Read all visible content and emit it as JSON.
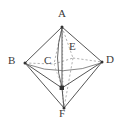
{
  "figure": {
    "name": "octahedron-diagram",
    "type": "geometry-solid-diagram",
    "shape": "octahedron",
    "background_color": "#ffffff",
    "stroke_color": "#4a4a4a",
    "hidden_stroke_color": "#9a9a9a",
    "label_color": "#3a3a3a",
    "width": 125,
    "height": 127
  },
  "labels": {
    "a": "A",
    "b": "B",
    "c": "C",
    "d": "D",
    "e": "E",
    "f": "F"
  },
  "vertices": [
    {
      "id": "A",
      "label": "A",
      "x": 62,
      "y": 27,
      "visible": true,
      "marker": "dot",
      "label_x": 58,
      "label_y": 11
    },
    {
      "id": "B",
      "label": "B",
      "x": 25,
      "y": 63,
      "visible": true,
      "marker": "dot",
      "label_x": 10,
      "label_y": 57
    },
    {
      "id": "C",
      "label": "C",
      "x": 54,
      "y": 64,
      "visible": false,
      "marker": "none",
      "label_x": 43,
      "label_y": 57
    },
    {
      "id": "D",
      "label": "D",
      "x": 102,
      "y": 62,
      "visible": true,
      "marker": "dot",
      "label_x": 106,
      "label_y": 56
    },
    {
      "id": "E",
      "label": "E",
      "x": 73,
      "y": 58,
      "visible": false,
      "marker": "none",
      "label_x": 68,
      "label_y": 43
    },
    {
      "id": "F",
      "label": "F",
      "x": 64,
      "y": 108,
      "visible": true,
      "marker": "dot",
      "label_x": 59,
      "label_y": 109
    },
    {
      "id": "G",
      "label": "",
      "x": 62,
      "y": 88,
      "visible": true,
      "marker": "square",
      "label_x": 0,
      "label_y": 0
    }
  ],
  "edges": [
    {
      "from": "A",
      "to": "B",
      "style": "solid"
    },
    {
      "from": "A",
      "to": "D",
      "style": "solid"
    },
    {
      "from": "A",
      "to": "G",
      "style": "solid"
    },
    {
      "from": "A",
      "to": "E",
      "style": "dashed"
    },
    {
      "from": "A",
      "to": "C",
      "style": "dashed"
    },
    {
      "from": "B",
      "to": "G",
      "style": "solid"
    },
    {
      "from": "D",
      "to": "G",
      "style": "solid"
    },
    {
      "from": "B",
      "to": "F",
      "style": "solid"
    },
    {
      "from": "D",
      "to": "F",
      "style": "solid"
    },
    {
      "from": "G",
      "to": "F",
      "style": "solid"
    },
    {
      "from": "B",
      "to": "C",
      "style": "dashed"
    },
    {
      "from": "C",
      "to": "E",
      "style": "dashed"
    },
    {
      "from": "E",
      "to": "D",
      "style": "dashed"
    },
    {
      "from": "E",
      "to": "F",
      "style": "dashed"
    },
    {
      "from": "C",
      "to": "F",
      "style": "solid"
    }
  ],
  "annotations": {
    "equator_front_arc": "B-G-D front lower edge",
    "equator_back_dashed": "B-C-E-D hidden rear edge",
    "axis_vertical_dotted": "A to F vertical axis through E"
  }
}
